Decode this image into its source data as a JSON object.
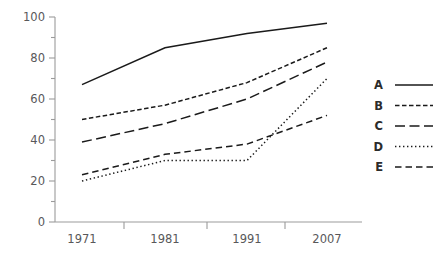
{
  "chart_data": {
    "type": "line",
    "title": "",
    "subtitle": "",
    "xlabel": "",
    "ylabel": "",
    "categories": [
      "1971",
      "1981",
      "1991",
      "2007"
    ],
    "xtick_labels": [
      "1971",
      "1981",
      "1991",
      "2007"
    ],
    "ytick_labels": [
      "0",
      "20",
      "40",
      "60",
      "80",
      "100"
    ],
    "ytick_values": [
      0,
      20,
      40,
      60,
      80,
      100
    ],
    "yminor_values": [
      10,
      30,
      50,
      70,
      90
    ],
    "ylim": [
      0,
      100
    ],
    "grid": false,
    "legend_position": "right",
    "legend_entries": [
      "A",
      "B",
      "C",
      "D",
      "E"
    ],
    "series": [
      {
        "name": "A",
        "values": [
          67,
          85,
          92,
          97
        ],
        "dash": "solid"
      },
      {
        "name": "B",
        "values": [
          50,
          57,
          68,
          85
        ],
        "dash": "short-dash"
      },
      {
        "name": "C",
        "values": [
          39,
          48,
          60,
          78
        ],
        "dash": "long-dash"
      },
      {
        "name": "D",
        "values": [
          20,
          30,
          30,
          70
        ],
        "dash": "dotted"
      },
      {
        "name": "E",
        "values": [
          23,
          33,
          38,
          52
        ],
        "dash": "medium-dash"
      }
    ]
  },
  "colors": {
    "line": "#1a1a1a",
    "axis": "#9b9b9b",
    "tick_text": "#58585a",
    "legend_text": "#2b2b2b",
    "background": "#ffffff"
  }
}
